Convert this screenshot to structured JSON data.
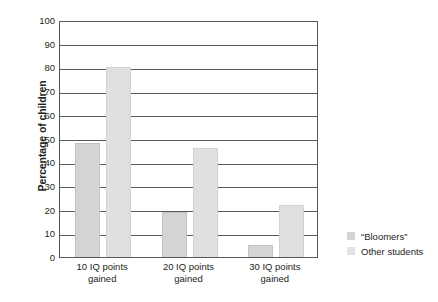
{
  "chart_data": {
    "type": "bar",
    "title": "",
    "subtitle": "",
    "xlabel": "",
    "ylabel": "Percentage of children",
    "categories": [
      "10 IQ points gained",
      "20 IQ points gained",
      "30 IQ points gained"
    ],
    "category_lines": [
      {
        "line1": "10 IQ points",
        "line2": "gained"
      },
      {
        "line1": "20 IQ points",
        "line2": "gained"
      },
      {
        "line1": "30 IQ points",
        "line2": "gained"
      }
    ],
    "series": [
      {
        "name": "“Bloomers”",
        "values": [
          48,
          19,
          5
        ],
        "color": "#d4d4d4"
      },
      {
        "name": "Other students",
        "values": [
          80,
          46,
          22
        ],
        "color": "#e0e0e0"
      }
    ],
    "ylim": [
      0,
      100
    ],
    "ytick_values": [
      100,
      90,
      80,
      70,
      60,
      50,
      40,
      30,
      20,
      10,
      0
    ],
    "ytick_labels": [
      "100",
      "90",
      "80",
      "70",
      "60",
      "50",
      "40",
      "30",
      "20",
      "10",
      "0"
    ],
    "grid": "horizontal",
    "legend_position": "right",
    "axis_color": "#58595b"
  },
  "legend": {
    "items": [
      {
        "label": "“Bloomers”"
      },
      {
        "label": "Other students"
      }
    ]
  }
}
